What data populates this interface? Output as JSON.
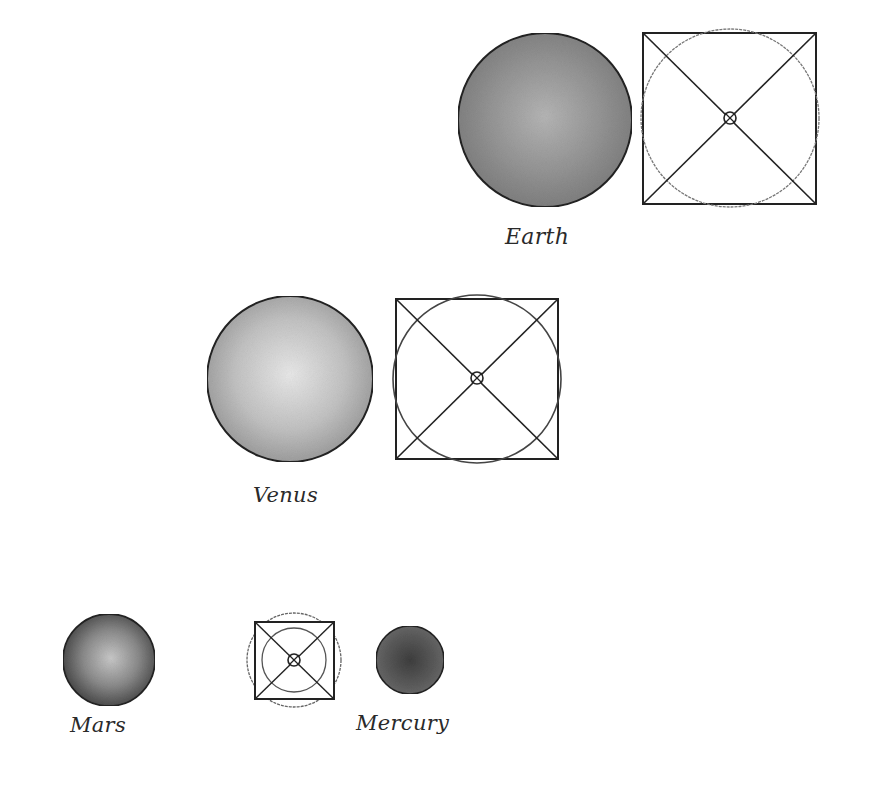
{
  "diagram": {
    "planets": [
      {
        "name": "Earth",
        "label": "Earth",
        "sphere_fill": "#8a8a8a",
        "sphere_highlight": "#b8b8b8"
      },
      {
        "name": "Venus",
        "label": "Venus",
        "sphere_fill": "#a8a8a8",
        "sphere_highlight": "#e6e6e6"
      },
      {
        "name": "Mars",
        "label": "Mars",
        "sphere_fill": "#5a5a5a",
        "sphere_highlight": "#c4c4c4"
      },
      {
        "name": "Mercury",
        "label": "Mercury",
        "sphere_fill": "#4a4a4a",
        "sphere_highlight": "#6a6a6a"
      }
    ],
    "colors": {
      "outline": "#222222",
      "construction_circle": "#666666",
      "background": "#ffffff"
    }
  }
}
